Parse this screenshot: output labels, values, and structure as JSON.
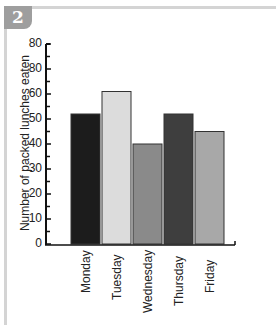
{
  "badge": {
    "number": "2"
  },
  "chart_data": {
    "type": "bar",
    "title": "",
    "xlabel": "",
    "ylabel": "Number of packed lunches eaten",
    "categories": [
      "Monday",
      "Tuesday",
      "Wednesday",
      "Thursday",
      "Friday"
    ],
    "values": [
      52,
      61,
      40,
      52,
      45
    ],
    "bar_colors": [
      "#1c1c1c",
      "#dcdcdc",
      "#8a8a8a",
      "#3e3e3e",
      "#a8a8a8"
    ],
    "ylim": [
      0,
      80
    ],
    "yticks": [
      0,
      10,
      20,
      30,
      40,
      50,
      60,
      70,
      80
    ],
    "ytick_labels": [
      "0",
      "10",
      "20",
      "30",
      "40",
      "50",
      "60",
      "80",
      "80"
    ],
    "grid": false,
    "legend": null
  }
}
